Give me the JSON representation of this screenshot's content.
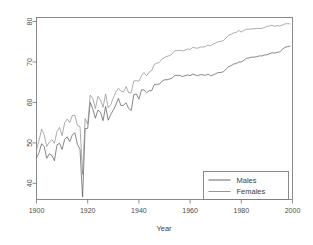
{
  "chart_data": {
    "type": "line",
    "title": "",
    "xlabel": "Year",
    "ylabel": "",
    "xlim": [
      1900,
      2000
    ],
    "ylim": [
      36,
      81
    ],
    "grid": false,
    "legend_position": "bottom-right",
    "xticks": [
      "1900",
      "1920",
      "1940",
      "1960",
      "1980",
      "2000"
    ],
    "xtick_values": [
      1900,
      1920,
      1940,
      1960,
      1980,
      2000
    ],
    "yticks": [
      "40",
      "50",
      "60",
      "70",
      "80"
    ],
    "ytick_values": [
      40,
      50,
      60,
      70,
      80
    ],
    "x": [
      1900,
      1901,
      1902,
      1903,
      1904,
      1905,
      1906,
      1907,
      1908,
      1909,
      1910,
      1911,
      1912,
      1913,
      1914,
      1915,
      1916,
      1917,
      1918,
      1919,
      1920,
      1921,
      1922,
      1923,
      1924,
      1925,
      1926,
      1927,
      1928,
      1929,
      1930,
      1931,
      1932,
      1933,
      1934,
      1935,
      1936,
      1937,
      1938,
      1939,
      1940,
      1941,
      1942,
      1943,
      1944,
      1945,
      1946,
      1947,
      1948,
      1949,
      1950,
      1951,
      1952,
      1953,
      1954,
      1955,
      1956,
      1957,
      1958,
      1959,
      1960,
      1961,
      1962,
      1963,
      1964,
      1965,
      1966,
      1967,
      1968,
      1969,
      1970,
      1971,
      1972,
      1973,
      1974,
      1975,
      1976,
      1977,
      1978,
      1979,
      1980,
      1981,
      1982,
      1983,
      1984,
      1985,
      1986,
      1987,
      1988,
      1989,
      1990,
      1991,
      1992,
      1993,
      1994,
      1995,
      1996,
      1997,
      1998,
      1999
    ],
    "series": [
      {
        "name": "Males",
        "color": "#555555",
        "values": [
          46.3,
          47.6,
          49.8,
          49.1,
          46.2,
          47.3,
          46.9,
          45.6,
          49.5,
          49.9,
          48.4,
          50.9,
          51.5,
          50.3,
          52.0,
          52.5,
          49.6,
          48.4,
          36.6,
          53.5,
          53.6,
          60.0,
          58.4,
          56.1,
          58.1,
          57.6,
          55.5,
          59.0,
          55.6,
          57.0,
          58.1,
          59.4,
          61.0,
          59.2,
          59.3,
          59.9,
          58.5,
          58.0,
          61.9,
          62.1,
          60.8,
          63.1,
          63.1,
          62.4,
          62.9,
          62.9,
          64.4,
          64.4,
          64.6,
          65.2,
          65.6,
          65.6,
          65.8,
          66.0,
          66.7,
          66.7,
          66.7,
          66.4,
          66.6,
          66.8,
          66.6,
          67.0,
          66.8,
          66.6,
          66.9,
          66.8,
          66.7,
          67.0,
          66.6,
          66.8,
          67.1,
          67.4,
          67.4,
          67.6,
          68.2,
          68.8,
          69.1,
          69.5,
          69.6,
          70.0,
          70.0,
          70.4,
          70.9,
          71.0,
          71.2,
          71.2,
          71.3,
          71.5,
          71.5,
          71.7,
          71.8,
          72.0,
          72.3,
          72.2,
          72.4,
          72.5,
          73.1,
          73.6,
          73.8,
          73.9
        ]
      },
      {
        "name": "Females",
        "color": "#8a8a8a",
        "values": [
          48.3,
          50.6,
          53.4,
          52.0,
          49.1,
          50.2,
          50.8,
          49.9,
          52.8,
          53.8,
          51.8,
          55.0,
          55.9,
          55.0,
          56.8,
          56.8,
          54.3,
          54.0,
          42.2,
          56.0,
          54.6,
          61.8,
          61.0,
          58.5,
          61.5,
          60.6,
          58.8,
          62.1,
          58.7,
          59.5,
          61.1,
          62.6,
          63.5,
          62.8,
          62.6,
          63.9,
          62.4,
          62.4,
          65.3,
          65.4,
          65.2,
          66.6,
          67.4,
          66.6,
          67.5,
          67.9,
          69.4,
          69.7,
          69.9,
          70.7,
          71.1,
          71.4,
          71.6,
          72.0,
          72.8,
          72.8,
          72.9,
          72.7,
          72.9,
          73.2,
          73.1,
          73.6,
          73.5,
          73.4,
          73.7,
          73.7,
          73.8,
          74.2,
          74.0,
          74.4,
          74.7,
          75.0,
          75.1,
          75.3,
          75.9,
          76.6,
          76.8,
          77.2,
          77.3,
          77.8,
          77.4,
          77.8,
          78.1,
          78.1,
          78.2,
          78.2,
          78.3,
          78.3,
          78.3,
          78.5,
          78.8,
          78.9,
          79.1,
          78.8,
          79.0,
          78.9,
          79.1,
          79.4,
          79.5,
          79.4
        ]
      }
    ]
  },
  "legend": {
    "entries": [
      {
        "label": "Males"
      },
      {
        "label": "Females"
      }
    ]
  },
  "axis": {
    "x_title": "Year"
  }
}
